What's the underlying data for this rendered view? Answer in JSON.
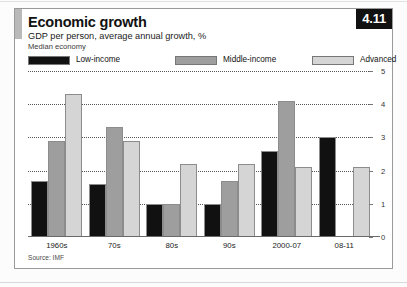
{
  "page": {
    "badge": "4.11",
    "title": "Economic growth",
    "subtitle": "GDP per person, average annual growth, %",
    "subtitle2": "Median economy",
    "source": "Source: IMF"
  },
  "colors": {
    "low_income": "#111111",
    "middle_income": "#9e9e9e",
    "advanced": "#d5d5d5",
    "badge_bg": "#111111",
    "badge_text": "#ffffff",
    "gridline": "#555555",
    "accent_block": "#b9b9b9"
  },
  "legend": [
    {
      "label": "Low-income",
      "color": "#111111"
    },
    {
      "label": "Middle-income",
      "color": "#9e9e9e"
    },
    {
      "label": "Advanced",
      "color": "#d5d5d5"
    }
  ],
  "axis": {
    "ticks": [
      "0",
      "1",
      "2",
      "3",
      "4",
      "5"
    ]
  },
  "chart_data": {
    "type": "bar",
    "title": "Economic growth",
    "subtitle": "GDP per person, average annual growth, %",
    "note": "Median economy",
    "source": "Source: IMF",
    "xlabel": "",
    "ylabel": "",
    "ylim": [
      0,
      5
    ],
    "yticks": [
      0,
      1,
      2,
      3,
      4,
      5
    ],
    "grid": true,
    "y_axis_position": "right",
    "legend_position": "top",
    "categories": [
      "1960s",
      "70s",
      "80s",
      "90s",
      "2000-07",
      "08-11"
    ],
    "series": [
      {
        "name": "Low-income",
        "color": "#111111",
        "values": [
          1.7,
          1.6,
          1.0,
          1.0,
          2.6,
          3.0
        ]
      },
      {
        "name": "Middle-income",
        "color": "#9e9e9e",
        "values": [
          2.9,
          3.3,
          1.0,
          1.7,
          4.1,
          null
        ]
      },
      {
        "name": "Advanced",
        "color": "#d5d5d5",
        "values": [
          4.3,
          2.9,
          2.2,
          2.2,
          2.1,
          2.1
        ]
      }
    ]
  }
}
